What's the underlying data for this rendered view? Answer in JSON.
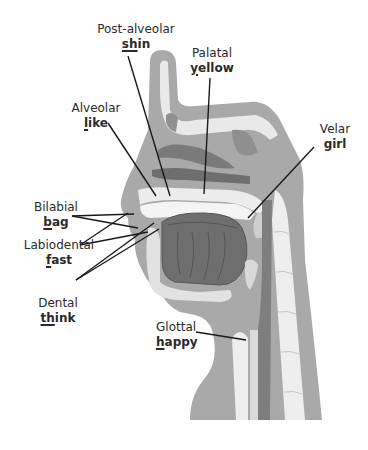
{
  "diagram": {
    "colors": {
      "skin": "#a9a9a9",
      "tissue": "#8f8f8f",
      "bone": "#e9e9e9",
      "tongue": "#6e6e6e",
      "dark": "#5e5e5e",
      "line": "#1a1a1a",
      "text": "#2a2a2a"
    },
    "labels": [
      {
        "id": "post-alveolar",
        "place": "Post-alveolar",
        "word_underlined": "sh",
        "word_rest": "in"
      },
      {
        "id": "palatal",
        "place": "Palatal",
        "word_underlined": "y",
        "word_rest": "ellow"
      },
      {
        "id": "alveolar",
        "place": "Alveolar",
        "word_underlined": "l",
        "word_rest": "ike"
      },
      {
        "id": "velar",
        "place": "Velar",
        "word_underlined": "g",
        "word_rest": "irl"
      },
      {
        "id": "bilabial",
        "place": "Bilabial",
        "word_underlined": "b",
        "word_rest": "ag"
      },
      {
        "id": "labiodental",
        "place": "Labiodental",
        "word_underlined": "f",
        "word_rest": "ast"
      },
      {
        "id": "dental",
        "place": "Dental",
        "word_underlined": "th",
        "word_rest": "ink"
      },
      {
        "id": "glottal",
        "place": "Glottal",
        "word_underlined": "h",
        "word_rest": "appy"
      }
    ]
  }
}
